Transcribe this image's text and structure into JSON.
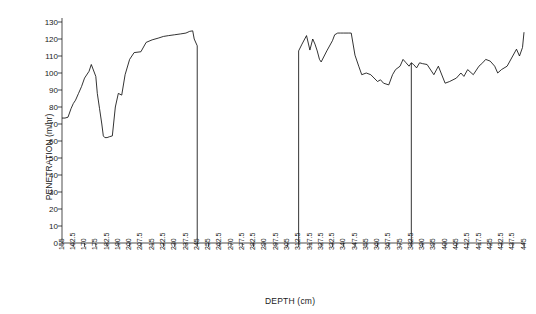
{
  "chart_data": {
    "type": "line",
    "title": "",
    "xlabel": "DEPTH (cm)",
    "ylabel": "PENETRATION (m/hr)",
    "ylim": [
      0,
      130
    ],
    "ytick_step": 10,
    "yticks": [
      0,
      10,
      20,
      30,
      40,
      50,
      60,
      70,
      80,
      90,
      100,
      110,
      120,
      130
    ],
    "grid": false,
    "legend": "none",
    "xtick_labels": [
      "155",
      "162.5",
      "170",
      "175",
      "182.5",
      "190",
      "200",
      "207.5",
      "215",
      "222.5",
      "230",
      "237.5",
      "245",
      "255",
      "262.5",
      "270",
      "277.5",
      "282.5",
      "290",
      "297.5",
      "305",
      "312.5",
      "317.5",
      "327.5",
      "332.5",
      "340",
      "347.5",
      "355",
      "360",
      "367.5",
      "375",
      "382.5",
      "390",
      "395",
      "400",
      "405",
      "412.5",
      "417.5",
      "425",
      "432.5",
      "437.5",
      "445"
    ],
    "series": [
      {
        "name": "Penetration rate",
        "x": [
          155,
          157,
          159,
          161,
          162.5,
          164,
          166,
          168,
          170,
          172,
          173,
          175,
          176,
          177.5,
          179,
          180,
          181,
          182.5,
          184,
          186,
          188,
          190,
          193,
          196,
          200,
          203,
          207.5,
          211,
          215,
          219,
          222.5,
          226,
          230,
          234,
          237.5,
          240,
          242,
          243,
          245,
          312.5,
          314,
          316,
          317.5,
          320,
          322,
          324,
          326,
          327.5,
          330,
          332.5,
          334,
          336,
          338,
          340,
          343,
          345,
          347.5,
          350,
          352,
          355,
          357,
          360,
          362,
          364,
          367.5,
          370,
          372,
          375,
          377,
          379,
          381,
          382.5,
          384,
          386,
          388,
          390,
          392,
          395,
          397,
          400,
          402,
          405,
          408,
          410,
          412.5,
          415,
          417.5,
          420,
          422,
          425,
          428,
          430,
          432.5,
          435,
          437.5,
          440,
          442,
          444,
          445
        ],
        "y": [
          73.5,
          73.5,
          74,
          79,
          82,
          84,
          88,
          92,
          97,
          101,
          105,
          98,
          88,
          79,
          70,
          63,
          62,
          62,
          62.5,
          63,
          80,
          88,
          87,
          99,
          108,
          112,
          112.5,
          118,
          119.5,
          120.5,
          121.5,
          122,
          122.5,
          123,
          123.5,
          124.5,
          124.8,
          120,
          116,
          113,
          117,
          122,
          113.5,
          120,
          117,
          113,
          108,
          106.5,
          113,
          119,
          122.5,
          123.5,
          123.5,
          123.5,
          123.5,
          123.5,
          110.5,
          104,
          99,
          100,
          99,
          95,
          96,
          94,
          93,
          99,
          102,
          104,
          108,
          106,
          104,
          106,
          105,
          103,
          106,
          105.5,
          105,
          99,
          104,
          94,
          95,
          97,
          100,
          98,
          102,
          99,
          104,
          106,
          108,
          107,
          104,
          100,
          102,
          104,
          110,
          114,
          110,
          115,
          124
        ]
      }
    ],
    "gap_lines": [
      {
        "x": 245,
        "note": "vertical drop at end of first segment"
      },
      {
        "x": 312.5,
        "note": "vertical rise at start of second segment"
      },
      {
        "x": 382.5,
        "note": "vertical drop mid second segment"
      }
    ]
  }
}
